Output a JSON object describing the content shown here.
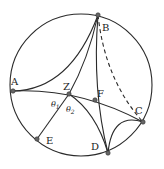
{
  "diagram": {
    "type": "hyperbolic-geometry-disk",
    "circle": {
      "cx": 81,
      "cy": 85,
      "r": 71
    },
    "points": [
      {
        "id": "A",
        "label": "A",
        "x": 13,
        "y": 91,
        "lx": 11,
        "ly": 85
      },
      {
        "id": "B",
        "label": "B",
        "x": 98,
        "y": 15,
        "lx": 102,
        "ly": 31
      },
      {
        "id": "C",
        "label": "C",
        "x": 143,
        "y": 122,
        "lx": 135,
        "ly": 114
      },
      {
        "id": "D",
        "label": "D",
        "x": 108,
        "y": 153,
        "lx": 91,
        "ly": 150
      },
      {
        "id": "E",
        "label": "E",
        "x": 37,
        "y": 139,
        "lx": 46,
        "ly": 144
      },
      {
        "id": "F",
        "label": "F",
        "x": 95,
        "y": 100,
        "lx": 97,
        "ly": 97
      },
      {
        "id": "Z",
        "label": "Z",
        "x": 69,
        "y": 94,
        "lx": 64,
        "ly": 90
      }
    ],
    "angles": [
      {
        "id": "theta1",
        "symbol": "θ",
        "sub": "1",
        "x": 51,
        "y": 106
      },
      {
        "id": "theta2",
        "symbol": "θ",
        "sub": "2",
        "x": 66,
        "y": 112
      }
    ],
    "colors": {
      "stroke": "#2a2a2a",
      "point_fill": "#666666",
      "background": "#ffffff"
    }
  }
}
